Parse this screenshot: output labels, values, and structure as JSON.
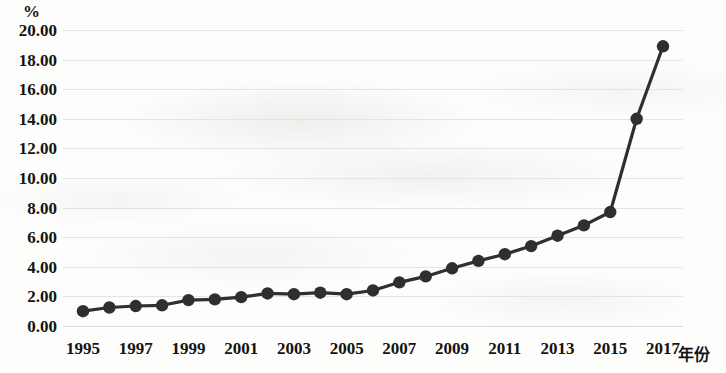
{
  "chart_data": {
    "type": "line",
    "title": "",
    "subtitle": "",
    "unit_label": "%",
    "xlabel": "年份",
    "ylabel": "",
    "ylim": [
      0,
      20
    ],
    "y_ticks": [
      "0.00",
      "2.00",
      "4.00",
      "6.00",
      "8.00",
      "10.00",
      "12.00",
      "14.00",
      "16.00",
      "18.00",
      "20.00"
    ],
    "y_tick_values": [
      0,
      2,
      4,
      6,
      8,
      10,
      12,
      14,
      16,
      18,
      20
    ],
    "x_tick_labels": [
      "1995",
      "1997",
      "1999",
      "2001",
      "2003",
      "2005",
      "2007",
      "2009",
      "2011",
      "2013",
      "2015",
      "2017"
    ],
    "x_tick_values": [
      1995,
      1997,
      1999,
      2001,
      2003,
      2005,
      2007,
      2009,
      2011,
      2013,
      2015,
      2017
    ],
    "xlim": [
      1995,
      2017
    ],
    "grid": "horizontal",
    "legend": "none",
    "marker": "circle",
    "line_color": "#2f2f2f",
    "marker_color": "#2f2f2f",
    "grid_color": "#e4e4e4",
    "text_color": "#15130f",
    "background_color": "#fdfdfc",
    "categories": [
      1995,
      1996,
      1997,
      1998,
      1999,
      2000,
      2001,
      2002,
      2003,
      2004,
      2005,
      2006,
      2007,
      2008,
      2009,
      2010,
      2011,
      2012,
      2013,
      2014,
      2015,
      2016,
      2017
    ],
    "values": [
      1.0,
      1.25,
      1.35,
      1.4,
      1.75,
      1.8,
      1.95,
      2.2,
      2.15,
      2.25,
      2.15,
      2.4,
      2.95,
      3.35,
      3.9,
      4.4,
      4.85,
      5.4,
      6.1,
      6.8,
      7.7,
      14.0,
      18.9
    ]
  }
}
